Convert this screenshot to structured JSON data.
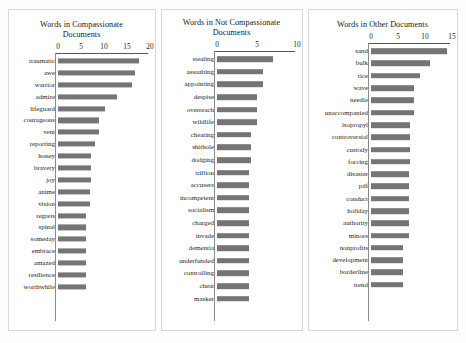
{
  "page": {
    "background": "#fdfdfd",
    "bar_color": "#757575",
    "panel_border": "#d8d8d8"
  },
  "charts": [
    {
      "id": "compassionate",
      "title_line1": "Words in Compassionate",
      "title_line2": "Documents",
      "chart_data": {
        "type": "bar",
        "orientation": "horizontal",
        "title": "Words in Compassionate Documents",
        "xlabel": "",
        "ylabel": "",
        "xlim": [
          0,
          20
        ],
        "ticks": [
          0,
          5,
          10,
          15,
          20
        ],
        "tick_labels": [
          "0",
          "5",
          "10",
          "15",
          "20"
        ],
        "grid": false,
        "legend": false,
        "categories": [
          "traumatic",
          "awe",
          "warrior",
          "admire",
          "lifeguard",
          "courageous",
          "vent",
          "reporting",
          "honey",
          "bravery",
          "joy",
          "anime",
          "vision",
          "regrets",
          "spinal",
          "someday",
          "embrace",
          "amazed",
          "resilience",
          "worthwhile"
        ],
        "values": [
          17.5,
          16.8,
          16.0,
          12.8,
          10.2,
          9.0,
          9.0,
          8.0,
          7.1,
          7.1,
          7.1,
          7.0,
          7.0,
          6.0,
          6.0,
          6.0,
          6.0,
          6.0,
          6.0,
          6.0
        ]
      }
    },
    {
      "id": "not-compassionate",
      "title_line1": "Words in Not Compassionate",
      "title_line2": "Documents",
      "chart_data": {
        "type": "bar",
        "orientation": "horizontal",
        "title": "Words in Not Compassionate Documents",
        "xlabel": "",
        "ylabel": "",
        "xlim": [
          0,
          10
        ],
        "ticks": [
          0,
          5,
          10
        ],
        "tick_labels": [
          "0",
          "5",
          "10"
        ],
        "grid": false,
        "legend": false,
        "categories": [
          "stealing",
          "assaulting",
          "appointing",
          "despise",
          "overreach",
          "wildlife",
          "cheating",
          "shithole",
          "dodging",
          "trillion",
          "accusers",
          "incompetent",
          "socialism",
          "charged",
          "invade",
          "dementia",
          "underfunded",
          "controlling",
          "cheat",
          "masker"
        ],
        "values": [
          7.0,
          5.8,
          5.8,
          5.0,
          5.0,
          5.0,
          4.2,
          4.2,
          4.2,
          4.0,
          4.0,
          4.0,
          4.0,
          4.0,
          4.0,
          4.0,
          4.0,
          4.0,
          4.0,
          4.0
        ]
      }
    },
    {
      "id": "other",
      "title_line1": "Words in Other Documents",
      "title_line2": "",
      "chart_data": {
        "type": "bar",
        "orientation": "horizontal",
        "title": "Words in Other Documents",
        "xlabel": "",
        "ylabel": "",
        "xlim": [
          0,
          15
        ],
        "ticks": [
          0,
          5,
          10,
          15
        ],
        "tick_labels": [
          "0",
          "5",
          "10",
          "15"
        ],
        "grid": false,
        "legend": false,
        "categories": [
          "sand",
          "bulk",
          "rice",
          "wave",
          "needle",
          "unaccompanied",
          "isopropyl",
          "controversial",
          "custody",
          "forcing",
          "disaster",
          "pdf",
          "conduct",
          "holiday",
          "authority",
          "minors",
          "nonprofits",
          "development",
          "borderline",
          "trend"
        ],
        "values": [
          14.0,
          11.0,
          9.0,
          8.0,
          8.0,
          8.0,
          7.2,
          7.2,
          7.2,
          7.2,
          7.0,
          7.0,
          7.0,
          7.0,
          7.0,
          7.0,
          6.0,
          6.0,
          6.0,
          6.0
        ]
      }
    }
  ]
}
